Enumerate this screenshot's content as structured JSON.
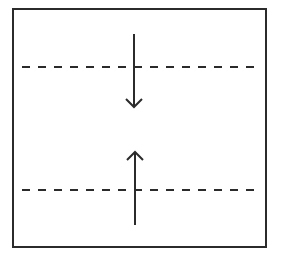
{
  "diagram": {
    "stroke_color": "#2b2b2b",
    "background": "#ffffff",
    "box": {
      "x": 13,
      "y": 9,
      "width": 253,
      "height": 238
    },
    "dashed_lines": [
      {
        "name": "upper-boundary",
        "y": 67,
        "x1": 22,
        "x2": 258
      },
      {
        "name": "lower-boundary",
        "y": 190,
        "x1": 22,
        "x2": 258
      }
    ],
    "arrows": [
      {
        "name": "down-arrow",
        "direction": "down",
        "x": 134,
        "y_start": 34,
        "y_end": 107
      },
      {
        "name": "up-arrow",
        "direction": "up",
        "x": 135,
        "y_start": 225,
        "y_end": 152
      }
    ]
  }
}
